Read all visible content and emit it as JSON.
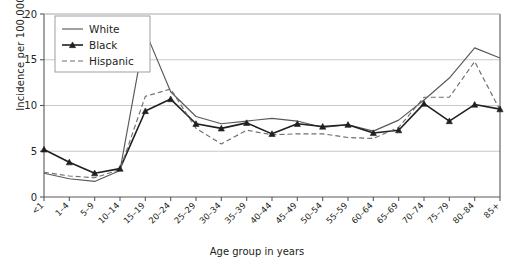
{
  "chart_data": {
    "type": "line",
    "title": "",
    "xlabel": "Age group in years",
    "ylabel": "Incidence per 100,000",
    "ylim": [
      0,
      20
    ],
    "yticks": [
      0,
      5,
      10,
      15,
      20
    ],
    "grid": true,
    "legend_position": "top-left",
    "categories": [
      "<1",
      "1–4",
      "5–9",
      "10–14",
      "15–19",
      "20–24",
      "25–29",
      "30–34",
      "35–39",
      "40–44",
      "45–49",
      "50–54",
      "55–59",
      "60–64",
      "65–69",
      "70–74",
      "75–79",
      "80–84",
      "85+"
    ],
    "series": [
      {
        "name": "White",
        "style": "solid",
        "marker": "none",
        "color": "#58595b",
        "values": [
          2.6,
          2.0,
          1.7,
          2.9,
          18.1,
          11.5,
          8.8,
          8.0,
          8.3,
          8.6,
          8.3,
          7.6,
          7.9,
          7.2,
          8.4,
          10.6,
          13.0,
          16.3,
          15.2
        ]
      },
      {
        "name": "Black",
        "style": "solid",
        "marker": "triangle",
        "color": "#231f20",
        "values": [
          5.2,
          3.8,
          2.6,
          3.1,
          9.4,
          10.7,
          8.0,
          7.5,
          8.1,
          6.9,
          8.0,
          7.7,
          7.9,
          7.0,
          7.3,
          10.2,
          8.3,
          10.1,
          9.6
        ]
      },
      {
        "name": "Hispanic",
        "style": "dashed",
        "marker": "none",
        "color": "#6d6e71",
        "values": [
          2.7,
          2.3,
          2.1,
          3.0,
          11.0,
          11.8,
          7.5,
          5.8,
          7.3,
          6.8,
          6.9,
          6.9,
          6.5,
          6.4,
          7.6,
          10.9,
          10.9,
          14.8,
          9.5
        ]
      }
    ]
  },
  "legend": {
    "items": [
      {
        "label": "White"
      },
      {
        "label": "Black"
      },
      {
        "label": "Hispanic"
      }
    ]
  },
  "axes": {
    "y_title": "Incidence per 100,000",
    "x_title": "Age group in years"
  }
}
